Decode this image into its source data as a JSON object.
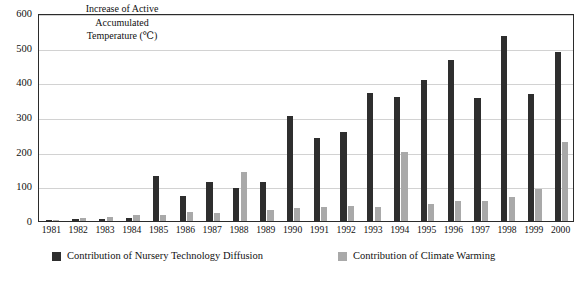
{
  "chart_data": {
    "type": "bar",
    "title": "Increase of Active Accumulated Temperature (℃)",
    "title_lines": [
      "Increase of Active",
      "Accumulated",
      "Temperature (℃)"
    ],
    "xlabel": "",
    "ylabel": "Increase of Active Accumulated Temperature (℃)",
    "ylim": [
      0,
      600
    ],
    "ytick_labels": [
      "600",
      "500",
      "400",
      "300",
      "200",
      "100",
      "0"
    ],
    "yticks": [
      600,
      500,
      400,
      300,
      200,
      100,
      0
    ],
    "grid": true,
    "grid_axis": "y",
    "legend_position": "bottom",
    "categories": [
      "1981",
      "1982",
      "1983",
      "1984",
      "1985",
      "1986",
      "1987",
      "1988",
      "1989",
      "1990",
      "1991",
      "1992",
      "1993",
      "1994",
      "1995",
      "1996",
      "1997",
      "1998",
      "1999",
      "2000"
    ],
    "series": [
      {
        "name": "Contribution of Nursery Technology Diffusion",
        "color": "#2e2e2e",
        "values": [
          3,
          5,
          7,
          10,
          130,
          72,
          112,
          95,
          112,
          302,
          240,
          256,
          368,
          357,
          408,
          464,
          355,
          535,
          366,
          488
        ]
      },
      {
        "name": "Contribution of Climate Warming",
        "color": "#a9a9a9",
        "values": [
          4,
          8,
          12,
          16,
          18,
          26,
          22,
          140,
          32,
          38,
          40,
          42,
          40,
          198,
          48,
          57,
          58,
          70,
          92,
          228
        ]
      }
    ]
  },
  "legend": {
    "entries": [
      {
        "label": "Contribution of Nursery Technology Diffusion",
        "swatch": "dark-square-icon"
      },
      {
        "label": "Contribution of Climate Warming",
        "swatch": "gray-square-icon"
      }
    ]
  },
  "colors": {
    "series_dark": "#2e2e2e",
    "series_light": "#a9a9a9",
    "gridline": "#d2d2d2",
    "frame": "#2b2b2b",
    "text": "#111111",
    "background": "#ffffff"
  }
}
